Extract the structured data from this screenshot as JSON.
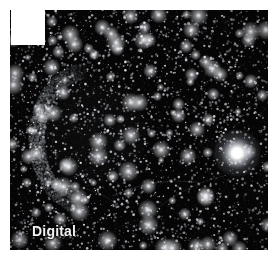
{
  "image": {
    "caption": "Digital",
    "kind": "astronomical-sky-image",
    "colors": {
      "background": "#000000",
      "sky": "#050505",
      "star": "#ffffff",
      "nebula": "#b9c3cc",
      "caption_text": "#f2f2f2",
      "border": "#ffffff",
      "corner_patch": "#ffffff"
    },
    "frame": {
      "width": 275,
      "height": 261,
      "plate_x": 10,
      "plate_y": 10,
      "plate_width": 258,
      "plate_height": 240
    },
    "corner_patch": {
      "x": 1,
      "y": 0,
      "width": 34,
      "height": 35
    },
    "bright_star": {
      "x": 237,
      "y": 153,
      "radius": 13,
      "core_radius": 5,
      "brightness": 1.0
    },
    "nebula": {
      "type": "supernova-remnant-arc",
      "center_x": 78,
      "center_y": 128,
      "radius_x": 52,
      "radius_y": 68,
      "arc_start_deg": 95,
      "arc_end_deg": 268,
      "rim_thickness": 7,
      "peak_opacity": 0.55
    },
    "starfield": {
      "count": 2600,
      "seed": 20240517,
      "faint_max_radius": 1.0,
      "bright_count": 120,
      "bright_max_radius": 2.6
    },
    "filaments": [
      {
        "x1": 112,
        "y1": 196,
        "x2": 196,
        "y2": 182,
        "opacity": 0.16
      },
      {
        "x1": 150,
        "y1": 214,
        "x2": 224,
        "y2": 176,
        "opacity": 0.13
      },
      {
        "x1": 60,
        "y1": 186,
        "x2": 120,
        "y2": 206,
        "opacity": 0.12
      }
    ]
  }
}
